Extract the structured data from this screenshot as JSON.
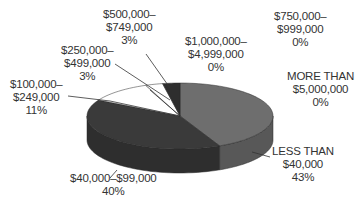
{
  "chart_data": {
    "type": "pie",
    "style": "3d",
    "title": "",
    "categories": [
      "LESS THAN $40,000",
      "$40,000-$99,000",
      "$100,000-$249,000",
      "$250,000-$499,000",
      "$500,000-$749,000",
      "$750,000-$999,000",
      "$1,000,000-$4,999,000",
      "MORE THAN $5,000,000"
    ],
    "values": [
      43,
      40,
      11,
      3,
      3,
      0,
      0,
      0
    ],
    "unit": "%",
    "colors": [
      "#6e6e6e",
      "#3a3a3a",
      "#ffffff",
      "#ffffff",
      "#2e2e2e",
      "#cccccc",
      "#cccccc",
      "#cccccc"
    ],
    "legend": "none (callout labels)"
  },
  "labels": [
    {
      "id": "less40k",
      "lines": [
        "LESS THAN",
        "$40,000",
        "43%"
      ]
    },
    {
      "id": "40to99k",
      "lines": [
        "$40,000–$99,000",
        "40%"
      ]
    },
    {
      "id": "100to249k",
      "lines": [
        "$100,000–",
        "$249,000",
        "11%"
      ]
    },
    {
      "id": "250to499k",
      "lines": [
        "$250,000–",
        "$499,000",
        "3%"
      ]
    },
    {
      "id": "500to749k",
      "lines": [
        "$500,000–",
        "$749,000",
        "3%"
      ]
    },
    {
      "id": "1mto4999k",
      "lines": [
        "$1,000,000–",
        "$4,999,000",
        "0%"
      ]
    },
    {
      "id": "750to999k",
      "lines": [
        "$750,000–",
        "$999,000",
        "0%"
      ]
    },
    {
      "id": "more5m",
      "lines": [
        "MORE THAN",
        "$5,000,000",
        "0%"
      ]
    }
  ]
}
